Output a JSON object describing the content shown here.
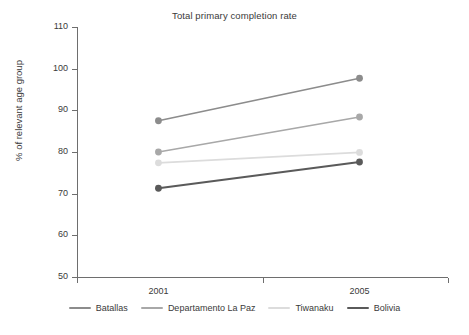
{
  "chart_data": {
    "type": "line",
    "title": "Total primary completion rate",
    "xlabel": "",
    "ylabel": "% of relevant age group",
    "categories": [
      "2001",
      "2005"
    ],
    "x": [
      2001,
      2005
    ],
    "ylim": [
      50,
      110
    ],
    "yticks": [
      50,
      60,
      70,
      80,
      90,
      100,
      110
    ],
    "ytick_labels": [
      "50",
      "60",
      "70",
      "80",
      "90",
      "100",
      "110"
    ],
    "grid": false,
    "legend_position": "bottom",
    "series": [
      {
        "name": "Batallas",
        "values": [
          87.5,
          97.7
        ],
        "color": "#8c8c8c"
      },
      {
        "name": "Departamento La Paz",
        "values": [
          80.0,
          88.4
        ],
        "color": "#a8a8a8"
      },
      {
        "name": "Tiwanaku",
        "values": [
          77.4,
          79.9
        ],
        "color": "#dcdcdc"
      },
      {
        "name": "Bolivia",
        "values": [
          71.3,
          77.6
        ],
        "color": "#5a5a5a"
      }
    ]
  },
  "legend": {
    "items": [
      {
        "label": "Batallas"
      },
      {
        "label": "Departamento La Paz"
      },
      {
        "label": "Tiwanaku"
      },
      {
        "label": "Bolivia"
      }
    ]
  }
}
